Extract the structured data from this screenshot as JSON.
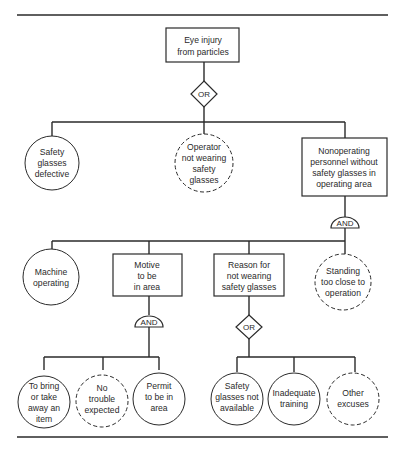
{
  "diagram": {
    "type": "fault-tree",
    "top_event": {
      "lines": [
        "Eye injury",
        "from particles"
      ]
    },
    "gates": {
      "top": "OR",
      "nonoperating": "AND",
      "motive": "AND",
      "reason": "OR"
    },
    "level1": {
      "safety_glasses_defective": {
        "lines": [
          "Safety",
          "glasses",
          "defective"
        ],
        "shape": "circle"
      },
      "operator_not_wearing": {
        "lines": [
          "Operator",
          "not wearing",
          "safety",
          "glasses"
        ],
        "shape": "dashed-circle"
      },
      "nonoperating_personnel": {
        "lines": [
          "Nonoperating",
          "personnel without",
          "safety glasses in",
          "operating area"
        ],
        "shape": "box"
      }
    },
    "level2": {
      "machine_operating": {
        "lines": [
          "Machine",
          "operating"
        ],
        "shape": "circle"
      },
      "motive": {
        "lines": [
          "Motive",
          "to be",
          "in area"
        ],
        "shape": "box"
      },
      "reason": {
        "lines": [
          "Reason for",
          "not wearing",
          "safety glasses"
        ],
        "shape": "box"
      },
      "standing_close": {
        "lines": [
          "Standing",
          "too close to",
          "operation"
        ],
        "shape": "dashed-circle"
      }
    },
    "level3_motive": [
      {
        "lines": [
          "To bring",
          "or take",
          "away an",
          "item"
        ],
        "shape": "circle"
      },
      {
        "lines": [
          "No",
          "trouble",
          "expected"
        ],
        "shape": "dashed-circle"
      },
      {
        "lines": [
          "Permit",
          "to be in",
          "area"
        ],
        "shape": "circle"
      }
    ],
    "level3_reason": [
      {
        "lines": [
          "Safety",
          "glasses not",
          "available"
        ],
        "shape": "circle"
      },
      {
        "lines": [
          "Inadequate",
          "training"
        ],
        "shape": "circle"
      },
      {
        "lines": [
          "Other",
          "excuses"
        ],
        "shape": "dashed-circle"
      }
    ]
  }
}
